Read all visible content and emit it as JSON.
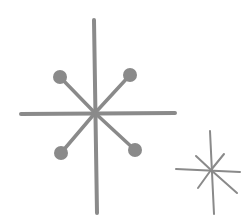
{
  "canvas": {
    "width": 249,
    "height": 216,
    "background": "#ffffff"
  },
  "style": {
    "stroke_color": "#8a8a8a"
  },
  "big_star": {
    "center": [
      95,
      113
    ],
    "vertical": [
      [
        94,
        20
      ],
      [
        97,
        213
      ]
    ],
    "horizontal": [
      [
        21,
        114
      ],
      [
        175,
        113
      ]
    ],
    "stroke_width": 4,
    "diagonals": [
      {
        "end": [
          60,
          77
        ],
        "dot_radius": 7
      },
      {
        "end": [
          130,
          75
        ],
        "dot_radius": 7
      },
      {
        "end": [
          61,
          153
        ],
        "dot_radius": 7
      },
      {
        "end": [
          135,
          150
        ],
        "dot_radius": 7
      }
    ],
    "diagonal_width": 3.5
  },
  "small_star": {
    "center": [
      211,
      170
    ],
    "vertical": [
      [
        210,
        131
      ],
      [
        214,
        214
      ]
    ],
    "horizontal": [
      [
        176,
        169
      ],
      [
        240,
        172
      ]
    ],
    "stroke_width": 2,
    "diagonals": [
      {
        "end": [
          196,
          156
        ]
      },
      {
        "end": [
          224,
          154
        ]
      },
      {
        "end": [
          198,
          188
        ]
      },
      {
        "end": [
          237,
          193
        ]
      }
    ]
  }
}
